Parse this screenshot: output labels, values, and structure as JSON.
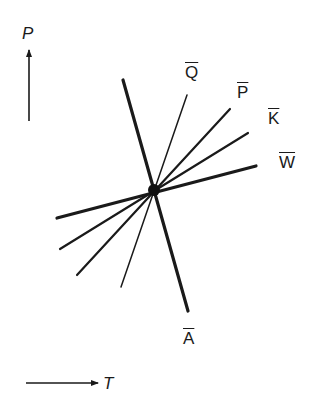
{
  "axes": {
    "y_axis_label": "P",
    "x_axis_label": "T"
  },
  "lines": [
    {
      "label": "Q",
      "overbar": true,
      "weight": "thin"
    },
    {
      "label": "P",
      "overbar": true,
      "weight": "medium"
    },
    {
      "label": "K",
      "overbar": true,
      "weight": "medium"
    },
    {
      "label": "W",
      "overbar": true,
      "weight": "thick"
    },
    {
      "label": "A",
      "overbar": true,
      "weight": "thick"
    }
  ],
  "colors": {
    "ink": "#1a1a1a",
    "background": "#ffffff"
  }
}
